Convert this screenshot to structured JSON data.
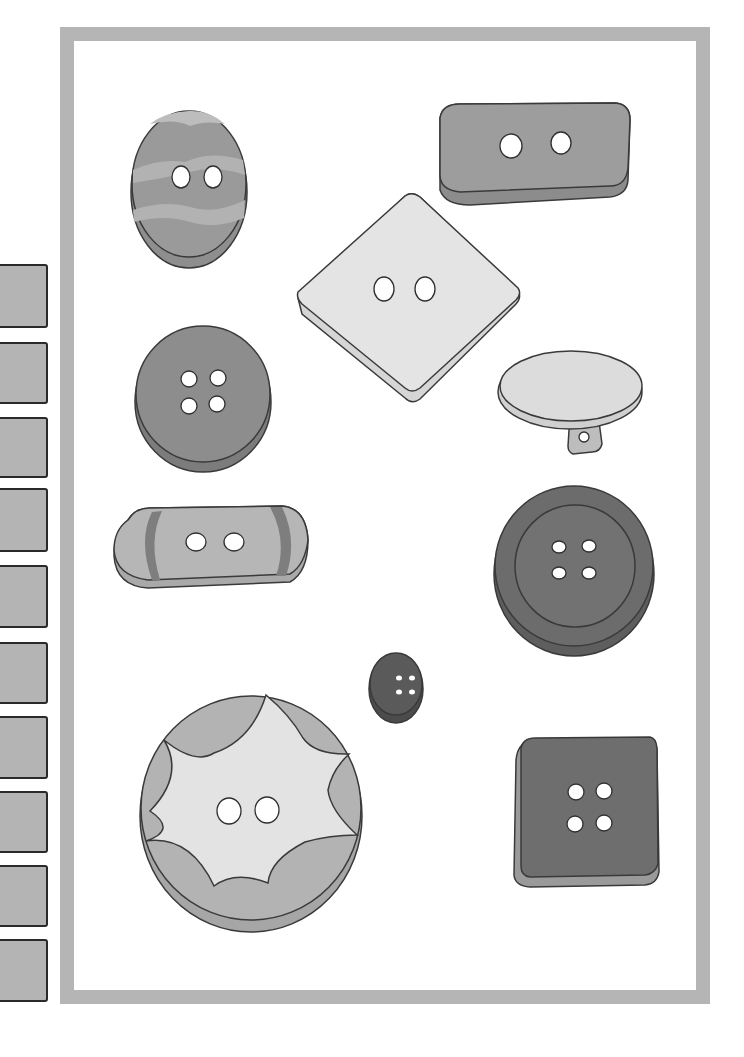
{
  "illustration": {
    "subject": "Assorted buttons",
    "frame_color": "#b5b5b5",
    "background": "#ffffff"
  },
  "side_tabs": {
    "count": 10,
    "color": "#b4b4b4",
    "border": "#2a2a2a",
    "items": [
      {
        "top": 264,
        "height": 64
      },
      {
        "top": 342,
        "height": 62
      },
      {
        "top": 417,
        "height": 61
      },
      {
        "top": 488,
        "height": 64
      },
      {
        "top": 565,
        "height": 63
      },
      {
        "top": 642,
        "height": 62
      },
      {
        "top": 716,
        "height": 63
      },
      {
        "top": 791,
        "height": 62
      },
      {
        "top": 865,
        "height": 62
      },
      {
        "top": 939,
        "height": 63
      }
    ]
  },
  "buttons": [
    {
      "name": "oval-striped-button",
      "holes": 2,
      "shape": "oval"
    },
    {
      "name": "rectangular-button",
      "holes": 2,
      "shape": "rounded-rectangle"
    },
    {
      "name": "diamond-button",
      "holes": 2,
      "shape": "rotated-square"
    },
    {
      "name": "round-four-hole-button",
      "holes": 4,
      "shape": "circle"
    },
    {
      "name": "shank-button",
      "holes": 1,
      "shape": "oval-with-shank"
    },
    {
      "name": "capsule-button",
      "holes": 2,
      "shape": "capsule"
    },
    {
      "name": "large-rimmed-button",
      "holes": 4,
      "shape": "circle-with-rim"
    },
    {
      "name": "small-dark-button",
      "holes": 4,
      "shape": "circle"
    },
    {
      "name": "star-pattern-button",
      "holes": 2,
      "shape": "circle-with-star"
    },
    {
      "name": "square-four-hole-button",
      "holes": 4,
      "shape": "square"
    }
  ]
}
